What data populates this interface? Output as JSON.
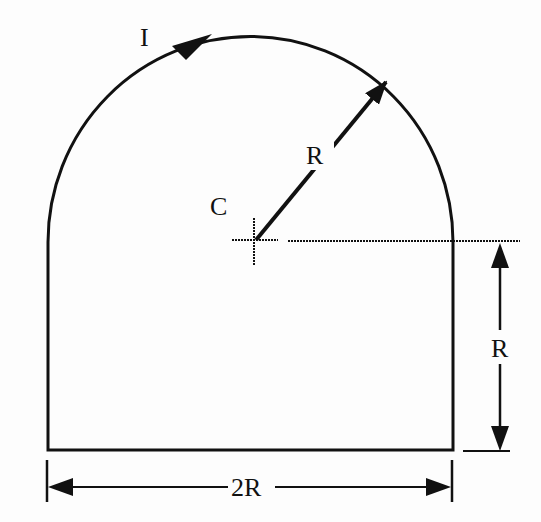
{
  "diagram": {
    "labels": {
      "current": "I",
      "center": "C",
      "radius": "R",
      "height": "R",
      "width": "2R"
    },
    "colors": {
      "stroke": "#111111",
      "background": "#fdfdfd"
    }
  }
}
